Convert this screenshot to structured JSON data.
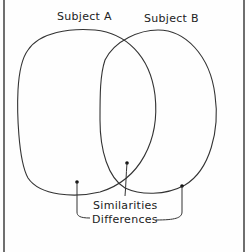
{
  "diagram": {
    "type": "venn",
    "sets": [
      {
        "label": "Subject A"
      },
      {
        "label": "Subject B"
      }
    ],
    "annotations": {
      "similarities": "Similarities",
      "differences": "Differences"
    },
    "colors": {
      "stroke": "#333333",
      "frame": "#6f6f6f",
      "background": "#fefefe"
    }
  }
}
